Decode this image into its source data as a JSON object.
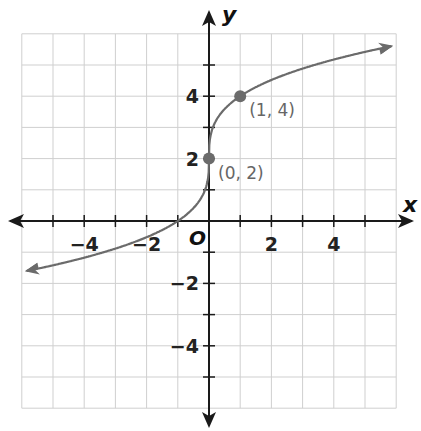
{
  "chart_data": {
    "type": "line",
    "title": "",
    "xlabel": "x",
    "ylabel": "y",
    "origin_label": "O",
    "xlim": [
      -6,
      6
    ],
    "ylim": [
      -6,
      6
    ],
    "grid": true,
    "x_tick_labels": [
      "−4",
      "−2",
      "2",
      "4"
    ],
    "x_tick_values": [
      -4,
      -2,
      2,
      4
    ],
    "y_tick_labels": [
      "4",
      "2",
      "−2",
      "−4"
    ],
    "y_tick_values": [
      4,
      2,
      -2,
      -4
    ],
    "series": [
      {
        "name": "curve",
        "function": "y = 2*cbrt(x) + 2",
        "x": [
          -6,
          -5,
          -4,
          -3,
          -2,
          -1,
          0,
          1,
          2,
          3,
          4,
          5,
          6
        ],
        "y": [
          -1.63,
          -1.42,
          -1.17,
          -0.88,
          -0.52,
          0,
          2,
          4,
          4.52,
          4.88,
          5.17,
          5.42,
          5.63
        ],
        "color": "#6b6b6b"
      }
    ],
    "points": [
      {
        "x": 0,
        "y": 2,
        "label": "(0, 2)"
      },
      {
        "x": 1,
        "y": 4,
        "label": "(1, 4)"
      }
    ]
  }
}
